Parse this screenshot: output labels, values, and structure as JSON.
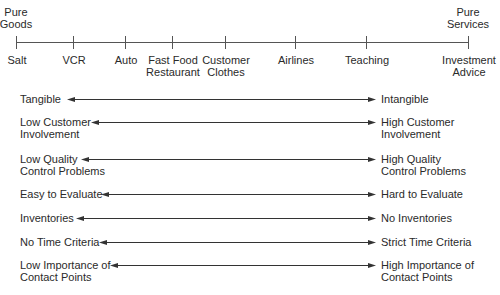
{
  "continuum": {
    "left_end_label": "Pure\nGoods",
    "right_end_label": "Pure\nServices",
    "items": [
      {
        "label": "Salt",
        "x": 16
      },
      {
        "label": "VCR",
        "x": 73
      },
      {
        "label": "Auto",
        "x": 125
      },
      {
        "label": "Fast Food\nRestaurant",
        "x": 172
      },
      {
        "label": "Customer\nClothes",
        "x": 225
      },
      {
        "label": "Airlines",
        "x": 295
      },
      {
        "label": "Teaching",
        "x": 366
      },
      {
        "label": "Investment\nAdvice",
        "x": 468
      }
    ]
  },
  "dimensions": [
    {
      "left": "Tangible",
      "right": "Intangible",
      "y": 99,
      "arrow_start": 67
    },
    {
      "left": "Low Customer\nInvolvement",
      "right": "High Customer\nInvolvement",
      "y": 122,
      "arrow_start": 91
    },
    {
      "left": "Low Quality\nControl Problems",
      "right": "High Quality\nControl Problems",
      "y": 159,
      "arrow_start": 81
    },
    {
      "left": "Easy to Evaluate",
      "right": "Hard to Evaluate",
      "y": 194,
      "arrow_start": 101
    },
    {
      "left": "Inventories",
      "right": "No Inventories",
      "y": 218,
      "arrow_start": 76
    },
    {
      "left": "No Time Criteria",
      "right": "Strict Time Criteria",
      "y": 242,
      "arrow_start": 99
    },
    {
      "left": "Low Importance of\nContact Points",
      "right": "High Importance of\nContact Points",
      "y": 265,
      "arrow_start": 110
    }
  ],
  "colors": {
    "line": "#555555",
    "arrow": "#333333",
    "text": "#2a2a2a"
  }
}
